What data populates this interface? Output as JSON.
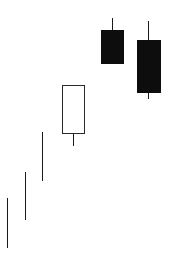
{
  "canvas": {
    "width": 173,
    "height": 267,
    "background": "#ffffff"
  },
  "style": {
    "line_color": "#1a1a1a",
    "bull_fill": "#ffffff",
    "bull_border": "#2b2b2b",
    "bear_fill": "#0d0d0d",
    "bear_border": "#0d0d0d",
    "wick_width": 1.6,
    "body_border_width": 1.6
  },
  "chart_data": {
    "type": "candlestick",
    "title": "",
    "subtitle": "",
    "xlabel": "",
    "ylabel": "",
    "grid": false,
    "axes_visible": false,
    "legend": "none",
    "tick_labels": [],
    "annotations": [],
    "note": "Six-session candlestick sequence rising left to right; first three sessions are doji (open equals close, body collapsed to a line), fourth is a tall hollow/bullish candle, last two are filled/bearish candles.",
    "categories": [
      "1",
      "2",
      "3",
      "4",
      "5",
      "6"
    ],
    "x_pixel_centers": [
      7,
      25,
      42,
      73,
      112,
      148
    ],
    "body_half_width_px": 11,
    "series": [
      {
        "name": "Price",
        "candles": [
          {
            "index": 1,
            "kind": "doji",
            "direction": "neutral",
            "filled": false,
            "body_px": {
              "top": 198,
              "bottom": 198,
              "left": 7,
              "right": 7
            },
            "wick_px": {
              "x": 7,
              "top": 198,
              "bottom": 248
            },
            "ohlc_px": {
              "high": 198,
              "open": 198,
              "close": 198,
              "low": 248
            }
          },
          {
            "index": 2,
            "kind": "doji",
            "direction": "neutral",
            "filled": false,
            "body_px": {
              "top": 172,
              "bottom": 172,
              "left": 25,
              "right": 25
            },
            "wick_px": {
              "x": 25,
              "top": 172,
              "bottom": 220
            },
            "ohlc_px": {
              "high": 172,
              "open": 172,
              "close": 172,
              "low": 220
            }
          },
          {
            "index": 3,
            "kind": "doji",
            "direction": "neutral",
            "filled": false,
            "body_px": {
              "top": 132,
              "bottom": 132,
              "left": 42,
              "right": 42
            },
            "wick_px": {
              "x": 42,
              "top": 132,
              "bottom": 181
            },
            "ohlc_px": {
              "high": 132,
              "open": 132,
              "close": 132,
              "low": 181
            }
          },
          {
            "index": 4,
            "kind": "real-body",
            "direction": "bullish",
            "filled": false,
            "body_px": {
              "top": 85,
              "bottom": 133,
              "left": 62,
              "right": 84
            },
            "wick_px": {
              "x": 73,
              "top": 85,
              "bottom": 146
            },
            "ohlc_px": {
              "high": 85,
              "open": 133,
              "close": 85,
              "low": 146
            }
          },
          {
            "index": 5,
            "kind": "real-body",
            "direction": "bearish",
            "filled": true,
            "body_px": {
              "top": 30,
              "bottom": 63,
              "left": 101,
              "right": 123
            },
            "wick_px": {
              "x": 112,
              "top": 18,
              "bottom": 63
            },
            "ohlc_px": {
              "high": 18,
              "open": 30,
              "close": 63,
              "low": 63
            }
          },
          {
            "index": 6,
            "kind": "real-body",
            "direction": "bearish",
            "filled": true,
            "body_px": {
              "top": 40,
              "bottom": 92,
              "left": 137,
              "right": 160
            },
            "wick_px": {
              "x": 148,
              "top": 21,
              "bottom": 99
            },
            "ohlc_px": {
              "high": 21,
              "open": 40,
              "close": 92,
              "low": 99
            }
          }
        ]
      }
    ]
  }
}
